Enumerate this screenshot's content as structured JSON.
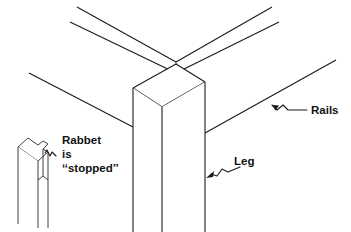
{
  "figure": {
    "background_color": "#ffffff",
    "ink_color": "#1a1a1a",
    "labels": {
      "rabbet_line1": "Rabbet",
      "rabbet_line2": "is",
      "rabbet_line3": "‘‘stopped’’",
      "rails": "Rails",
      "leg": "Leg"
    },
    "parts": {
      "leg": "leg-post",
      "rail_left": "rail-left",
      "rail_right": "rail-right",
      "detail": "stopped-rabbet-detail"
    }
  }
}
